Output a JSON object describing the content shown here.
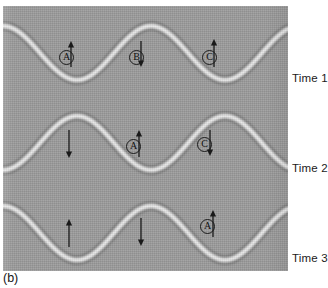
{
  "figure": {
    "caption": "(b)",
    "panel_bg_color": "#9b9b9b",
    "wave_color": "#f2f2f2",
    "ink_color": "#1a1a1a"
  },
  "chart_data": {
    "type": "line",
    "title": "",
    "subtitle": "",
    "xlabel": "",
    "ylabel": "",
    "grid": false,
    "legend": "none",
    "x": [
      0,
      285
    ],
    "wavelength_px": 148,
    "amplitude_px": 27,
    "series": [
      {
        "name": "Time 1",
        "row_index": 0,
        "baseline_y": 47,
        "phase_shift_px": 0,
        "crests_x": [
          67,
          215
        ],
        "troughs_x": [
          143
        ],
        "row_label": "Time 1",
        "row_label_x": 292,
        "row_label_y": 72
      },
      {
        "name": "Time 2",
        "row_index": 1,
        "baseline_y": 137,
        "phase_shift_px": 74,
        "crests_x": [
          140
        ],
        "troughs_x": [
          72,
          212
        ],
        "row_label": "Time 2",
        "row_label_x": 292,
        "row_label_y": 162
      },
      {
        "name": "Time 3",
        "row_index": 2,
        "baseline_y": 227,
        "phase_shift_px": 148,
        "crests_x": [
          68,
          215
        ],
        "troughs_x": [
          143
        ],
        "row_label": "Time 3",
        "row_label_x": 292,
        "row_label_y": 252
      }
    ],
    "annotations": [
      {
        "id": "r1-a",
        "row": "Time 1",
        "label": "A",
        "labeled": true,
        "arrow": "up",
        "circle_x": 56,
        "circle_y": 44,
        "arrow_x": 68,
        "arrow_y": 35,
        "arrow_len": 26
      },
      {
        "id": "r1-b",
        "row": "Time 1",
        "label": "B",
        "labeled": true,
        "arrow": "down",
        "circle_x": 126,
        "circle_y": 44,
        "arrow_x": 138,
        "arrow_y": 35,
        "arrow_len": 26
      },
      {
        "id": "r1-c",
        "row": "Time 1",
        "label": "C",
        "labeled": true,
        "arrow": "up",
        "circle_x": 199,
        "circle_y": 44,
        "arrow_x": 211,
        "arrow_y": 33,
        "arrow_len": 28
      },
      {
        "id": "r2-1",
        "row": "Time 2",
        "label": "",
        "labeled": false,
        "arrow": "down",
        "circle_x": 0,
        "circle_y": 0,
        "arrow_x": 66,
        "arrow_y": 124,
        "arrow_len": 28
      },
      {
        "id": "r2-a",
        "row": "Time 2",
        "label": "A",
        "labeled": true,
        "arrow": "up",
        "circle_x": 123,
        "circle_y": 133,
        "arrow_x": 136,
        "arrow_y": 124,
        "arrow_len": 27
      },
      {
        "id": "r2-c",
        "row": "Time 2",
        "label": "C",
        "labeled": true,
        "arrow": "down",
        "circle_x": 194,
        "circle_y": 131,
        "arrow_x": 207,
        "arrow_y": 124,
        "arrow_len": 26
      },
      {
        "id": "r3-1",
        "row": "Time 3",
        "label": "",
        "labeled": false,
        "arrow": "up",
        "circle_x": 0,
        "circle_y": 0,
        "arrow_x": 66,
        "arrow_y": 213,
        "arrow_len": 28
      },
      {
        "id": "r3-2",
        "row": "Time 3",
        "label": "",
        "labeled": false,
        "arrow": "down",
        "circle_x": 0,
        "circle_y": 0,
        "arrow_x": 138,
        "arrow_y": 212,
        "arrow_len": 28
      },
      {
        "id": "r3-a",
        "row": "Time 3",
        "label": "A",
        "labeled": true,
        "arrow": "up",
        "circle_x": 197,
        "circle_y": 213,
        "arrow_x": 210,
        "arrow_y": 204,
        "arrow_len": 27
      }
    ]
  }
}
